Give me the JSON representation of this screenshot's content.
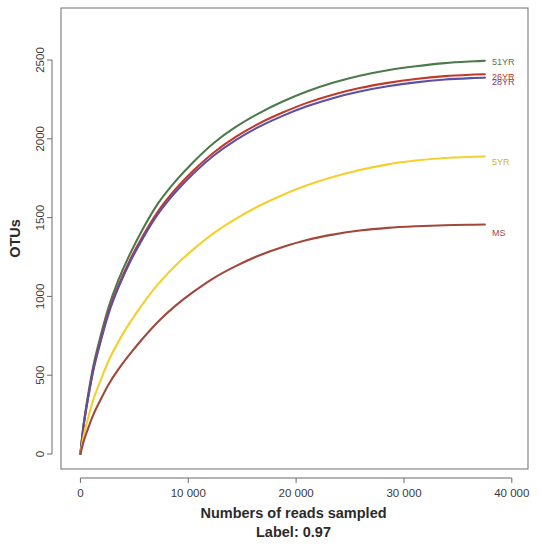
{
  "chart_data": {
    "type": "line",
    "title": "",
    "xlabel": "Numbers of reads sampled",
    "ylabel": "OTUs",
    "subtitle": "Label: 0.97",
    "xlim": [
      -1800,
      41500
    ],
    "ylim": [
      -95,
      2830
    ],
    "xticks": [
      0,
      10000,
      20000,
      30000,
      40000
    ],
    "xticklabels": [
      "0",
      "10 000",
      "20 000",
      "30 000",
      "40 000"
    ],
    "yticks": [
      0,
      500,
      1000,
      1500,
      2000,
      2500
    ],
    "yticklabels": [
      "0",
      "500",
      "1000",
      "1500",
      "2000",
      "2500"
    ],
    "grid": false,
    "legend_position": "right-inline-labels",
    "series": [
      {
        "name": "51YR",
        "color": "#4d7a4a",
        "label_color": "#4d7a4a",
        "label_x": 37600,
        "label_y": 2485,
        "x": [
          0,
          300,
          700,
          1200,
          1800,
          2600,
          3500,
          4600,
          5800,
          7200,
          8800,
          10500,
          12400,
          14400,
          16500,
          18700,
          21000,
          23400,
          25900,
          28500,
          31100,
          33800,
          36500,
          37500
        ],
        "y": [
          0,
          190,
          370,
          560,
          730,
          930,
          1100,
          1270,
          1430,
          1590,
          1730,
          1855,
          1975,
          2075,
          2160,
          2235,
          2300,
          2355,
          2400,
          2435,
          2460,
          2480,
          2492,
          2495
        ]
      },
      {
        "name": "26YR",
        "color": "#c0392b",
        "label_color": "#b03a2e",
        "label_x": 37600,
        "label_y": 2395,
        "x": [
          0,
          300,
          700,
          1200,
          1800,
          2600,
          3500,
          4600,
          5800,
          7200,
          8800,
          10500,
          12400,
          14400,
          16500,
          18700,
          21000,
          23400,
          25900,
          28500,
          31100,
          33800,
          36500,
          37500
        ],
        "y": [
          0,
          183,
          356,
          540,
          705,
          900,
          1065,
          1232,
          1385,
          1540,
          1678,
          1800,
          1915,
          2012,
          2095,
          2165,
          2228,
          2280,
          2322,
          2355,
          2380,
          2398,
          2408,
          2410
        ]
      },
      {
        "name": "28YR",
        "color": "#5b4fa8",
        "label_color": "#7b3f7a",
        "label_x": 37600,
        "label_y": 2358,
        "x": [
          0,
          300,
          700,
          1200,
          1800,
          2600,
          3500,
          4600,
          5800,
          7200,
          8800,
          10500,
          12400,
          14400,
          16500,
          18700,
          21000,
          23400,
          25900,
          28500,
          31100,
          33800,
          36500,
          37500
        ],
        "y": [
          0,
          180,
          350,
          532,
          695,
          888,
          1052,
          1218,
          1370,
          1523,
          1660,
          1782,
          1896,
          1992,
          2074,
          2144,
          2206,
          2258,
          2300,
          2333,
          2358,
          2376,
          2386,
          2388
        ]
      },
      {
        "name": "5YR",
        "color": "#f5cf2e",
        "label_color": "#d4b520",
        "label_x": 37600,
        "label_y": 1855,
        "x": [
          0,
          300,
          700,
          1200,
          1800,
          2600,
          3500,
          4600,
          5800,
          7200,
          8800,
          10500,
          12400,
          14400,
          16500,
          18700,
          21000,
          23400,
          25900,
          28500,
          31100,
          33800,
          36500,
          37500
        ],
        "y": [
          0,
          115,
          225,
          345,
          455,
          590,
          710,
          835,
          955,
          1078,
          1195,
          1300,
          1403,
          1492,
          1572,
          1642,
          1705,
          1758,
          1802,
          1838,
          1862,
          1878,
          1886,
          1888
        ]
      },
      {
        "name": "MS",
        "color": "#a0483c",
        "label_color": "#a0483c",
        "label_x": 37600,
        "label_y": 1400,
        "x": [
          0,
          300,
          700,
          1200,
          1800,
          2600,
          3500,
          4600,
          5800,
          7200,
          8800,
          10500,
          12400,
          14400,
          16500,
          18700,
          21000,
          23400,
          25900,
          28500,
          31100,
          33800,
          36500,
          37500
        ],
        "y": [
          0,
          80,
          160,
          250,
          335,
          440,
          535,
          635,
          735,
          840,
          940,
          1030,
          1118,
          1192,
          1258,
          1312,
          1358,
          1392,
          1418,
          1435,
          1445,
          1452,
          1455,
          1456
        ]
      }
    ]
  },
  "axis": {
    "x_title": "Numbers of reads sampled",
    "y_title": "OTUs",
    "sub_title": "Label: 0.97"
  }
}
